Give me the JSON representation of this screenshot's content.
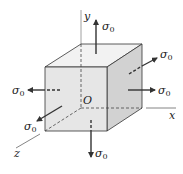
{
  "diagram": {
    "axes": {
      "x": "x",
      "y": "y",
      "z": "z"
    },
    "origin_label": "O",
    "stress_symbol": "σ",
    "stress_subscript": "0",
    "stress_labels": [
      {
        "face": "top",
        "direction": "+y",
        "text": "σ",
        "sub": "0"
      },
      {
        "face": "bottom",
        "direction": "-y",
        "text": "σ",
        "sub": "0"
      },
      {
        "face": "right",
        "direction": "+x",
        "text": "σ",
        "sub": "0"
      },
      {
        "face": "left",
        "direction": "-x",
        "text": "σ",
        "sub": "0"
      },
      {
        "face": "front",
        "direction": "+z",
        "text": "σ",
        "sub": "0"
      },
      {
        "face": "back",
        "direction": "-z",
        "text": "σ",
        "sub": "0"
      }
    ],
    "colors": {
      "front_face": "#e6e6e6",
      "side_face": "#d2d2d2",
      "top_face": "#f2f2f2",
      "edges": "#333333",
      "arrows": "#333333"
    }
  }
}
